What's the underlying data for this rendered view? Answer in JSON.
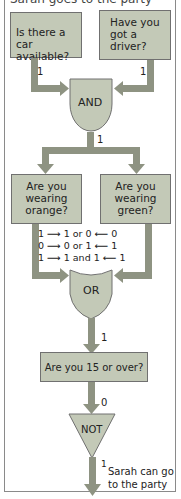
{
  "header": {
    "cut_text": "Sarah goes to the party"
  },
  "boxes": {
    "car": {
      "lines": [
        "Is there a car",
        "available?"
      ]
    },
    "driver": {
      "lines": [
        "Have you",
        "got a",
        "driver?"
      ]
    },
    "orange": {
      "lines": [
        "Are you",
        "wearing",
        "orange?"
      ]
    },
    "green": {
      "lines": [
        "Are you",
        "wearing",
        "green?"
      ]
    },
    "age": {
      "lines": [
        "Are you 15 or over?"
      ]
    }
  },
  "gates": {
    "and": "AND",
    "or": "OR",
    "not": "NOT"
  },
  "signals": {
    "car_out": "1",
    "driver_out": "1",
    "and_out": "1",
    "or_out": "1",
    "age_out": "0",
    "not_out": "1"
  },
  "truth_rows": [
    {
      "left": "1",
      "center": "1 or 0",
      "right": "0"
    },
    {
      "left": "0",
      "center": "0 or 1",
      "right": "1"
    },
    {
      "left": "1",
      "center": "1 and 1",
      "right": "1"
    }
  ],
  "result": {
    "lines": [
      "Sarah can go",
      "to the party"
    ]
  },
  "colors": {
    "box": "#c3c9b7",
    "pipe": "#8e9382",
    "gate": "#c3c9b7"
  }
}
